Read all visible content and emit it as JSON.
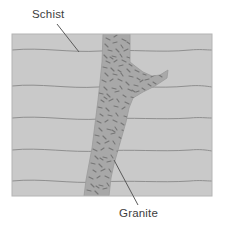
{
  "figure": {
    "kind": "geology-cross-section-diagram",
    "background_color": "#ffffff",
    "frame": {
      "x": 12,
      "y": 34,
      "width": 200,
      "height": 162,
      "border_color": "#b4b4b4"
    },
    "rock_units": [
      {
        "name": "Schist",
        "role": "host-rock",
        "fill_color": "#c9c9c9",
        "foliation_line_color": "#8f8f8f",
        "foliation_line_count": 5,
        "foliation_line_y": [
          50,
          86,
          118,
          150,
          181
        ]
      },
      {
        "name": "Granite",
        "role": "intrusive-dike",
        "fill_color": "#a9a9a9",
        "speckle_color": "#7a7a7a",
        "shape_description": "vertical dike widening downward with one branch extending to the upper right"
      }
    ]
  },
  "labels": [
    {
      "id": "schist",
      "text": "Schist",
      "text_x": 32,
      "text_y": 18,
      "leader": {
        "x1": 57,
        "y1": 24,
        "x2": 79,
        "y2": 52,
        "color": "#5a5a5a"
      }
    },
    {
      "id": "granite",
      "text": "Granite",
      "text_x": 119,
      "text_y": 217,
      "leader": {
        "x1": 138,
        "y1": 205,
        "x2": 114,
        "y2": 160,
        "color": "#5a5a5a"
      }
    }
  ],
  "colors": {
    "page_background": "#ffffff",
    "schist_fill": "#c9c9c9",
    "granite_fill": "#a9a9a9",
    "granite_speckle": "#7a7a7a",
    "foliation_line": "#8f8f8f",
    "frame_border": "#b4b4b4",
    "label_text": "#3d3d3d",
    "leader_line": "#5a5a5a"
  }
}
